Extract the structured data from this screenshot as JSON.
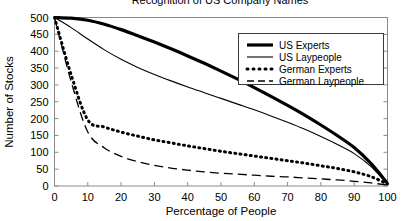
{
  "chart_data": {
    "type": "line",
    "title": "Recognition of US Company Names",
    "xlabel": "Percentage of People",
    "ylabel": "Number of Stocks",
    "xlim": [
      0,
      100
    ],
    "ylim": [
      0,
      500
    ],
    "xticks": [
      0,
      10,
      20,
      30,
      40,
      50,
      60,
      70,
      80,
      90,
      100
    ],
    "yticks": [
      0,
      50,
      100,
      150,
      200,
      250,
      300,
      350,
      400,
      450,
      500
    ],
    "grid": false,
    "legend_position": "top-right",
    "x": [
      0,
      5,
      10,
      15,
      20,
      25,
      30,
      35,
      40,
      45,
      50,
      55,
      60,
      65,
      70,
      75,
      80,
      85,
      90,
      95,
      100
    ],
    "series": [
      {
        "name": "US Experts",
        "style": "solid-thick",
        "stroke_width": 3.2,
        "dash": "none",
        "color": "#000000",
        "values": [
          500,
          498,
          492,
          480,
          464,
          446,
          427,
          407,
          386,
          364,
          341,
          317,
          292,
          266,
          239,
          211,
          181,
          149,
          114,
          67,
          8
        ]
      },
      {
        "name": "US Laypeople",
        "style": "solid-thin",
        "stroke_width": 1.1,
        "dash": "none",
        "color": "#000000",
        "values": [
          500,
          470,
          436,
          404,
          376,
          352,
          331,
          312,
          294,
          277,
          260,
          243,
          226,
          208,
          189,
          169,
          147,
          123,
          96,
          58,
          5
        ]
      },
      {
        "name": "German Experts",
        "style": "dotted-thick",
        "stroke_width": 3.0,
        "dash": "1,4.2",
        "color": "#000000",
        "values": [
          500,
          330,
          196,
          175,
          160,
          148,
          137,
          128,
          119,
          111,
          103,
          96,
          89,
          82,
          75,
          68,
          60,
          52,
          42,
          28,
          6
        ]
      },
      {
        "name": "German Laypeople",
        "style": "dashed",
        "stroke_width": 1.3,
        "dash": "9,5",
        "color": "#000000",
        "values": [
          500,
          310,
          160,
          113,
          88,
          72,
          61,
          53,
          47,
          42,
          38,
          35,
          32,
          29,
          27,
          24,
          21,
          18,
          14,
          9,
          3
        ]
      }
    ]
  },
  "legend": {
    "entries": [
      {
        "label": "US Experts"
      },
      {
        "label": "US Laypeople"
      },
      {
        "label": "German Experts"
      },
      {
        "label": "German Laypeople"
      }
    ]
  }
}
